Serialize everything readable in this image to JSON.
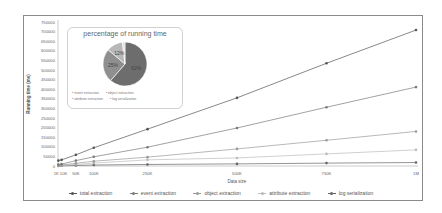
{
  "chart_data": {
    "type": "line",
    "title": "",
    "xlabel": "Data size",
    "ylabel": "Running time (ms)",
    "x": [
      "1K",
      "10K",
      "50K",
      "100K",
      "250K",
      "500K",
      "750K",
      "1M"
    ],
    "x_numeric": [
      1000,
      10000,
      50000,
      100000,
      250000,
      500000,
      750000,
      1000000
    ],
    "ylim": [
      0,
      750000
    ],
    "yticks": [
      0,
      50000,
      100000,
      150000,
      200000,
      250000,
      300000,
      350000,
      400000,
      450000,
      500000,
      550000,
      600000,
      650000,
      700000,
      750000
    ],
    "grid": false,
    "legend_position": "bottom",
    "series": [
      {
        "name": "total extraction",
        "color": "#555555",
        "values": [
          28000,
          32000,
          58000,
          95000,
          192000,
          355000,
          535000,
          708000
        ]
      },
      {
        "name": "event extraction",
        "color": "#7a7a7a",
        "values": [
          8000,
          10000,
          28000,
          48000,
          98000,
          198000,
          306000,
          411000
        ]
      },
      {
        "name": "object extraction",
        "color": "#9a9a9a",
        "values": [
          3000,
          5000,
          14000,
          25000,
          46000,
          89000,
          134000,
          180000
        ]
      },
      {
        "name": "attribute extraction",
        "color": "#bbbbbb",
        "values": [
          1500,
          2500,
          8000,
          15000,
          32000,
          42000,
          63000,
          84000
        ]
      },
      {
        "name": "log serialization",
        "color": "#666666",
        "values": [
          500,
          1000,
          3000,
          5000,
          8000,
          11000,
          15000,
          18000
        ]
      }
    ],
    "inset": {
      "type": "pie",
      "title": "percentage of running time",
      "categories": [
        "event extraction",
        "object extraction",
        "attribute extraction",
        "log serialization"
      ],
      "values": [
        62,
        25,
        12,
        2
      ],
      "labels": [
        "62%",
        "25%",
        "12%",
        "2%"
      ],
      "colors": [
        "#6d6d6d",
        "#8f8f8f",
        "#b8b8b8",
        "#e0e0e0"
      ]
    }
  },
  "labels": {
    "xlabel": "Data size",
    "ylabel": "Running time (ms)",
    "pie_title": "percentage of running time",
    "pie_legend": [
      "event extraction",
      "object extraction",
      "attribute extraction",
      "log serialization"
    ],
    "legend": [
      "total extraction",
      "event extraction",
      "object extraction",
      "attribute extraction",
      "log serialization"
    ]
  }
}
